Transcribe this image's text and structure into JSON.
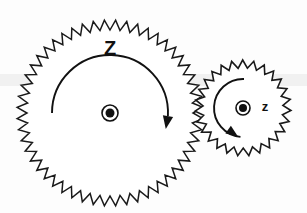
{
  "figure": {
    "type": "gear-pair-diagram",
    "background_color": "#fdfdfd",
    "line_color": "#111111",
    "band_color": "#efefef"
  },
  "gears": [
    {
      "id": "large-gear",
      "label": "Z",
      "label_case": "uppercase",
      "role": "driver",
      "center_x": 110,
      "center_y": 113,
      "outer_radius": 93,
      "root_radius": 83,
      "tooth_count": 52,
      "rotation_direction": "clockwise",
      "label_x": 110,
      "label_y": 50,
      "hub_outer_radius": 8,
      "hub_inner_radius": 4.5,
      "arc_radius": 58,
      "arc_start_deg": 180,
      "arc_end_deg": 3
    },
    {
      "id": "small-gear",
      "label": "z",
      "label_case": "lowercase",
      "role": "driven",
      "center_x": 243,
      "center_y": 108,
      "outer_radius": 48,
      "root_radius": 40,
      "tooth_count": 27,
      "rotation_direction": "counter-clockwise",
      "label_x": 265,
      "label_y": 108,
      "hub_outer_radius": 7,
      "hub_inner_radius": 4,
      "arc_radius": 29,
      "arc_start_deg": 272,
      "arc_end_deg": 95
    }
  ],
  "annotations": {
    "large_arrow_label": "Z",
    "small_arrow_label": "z",
    "mesh_note": "gears meshed at contact point"
  }
}
